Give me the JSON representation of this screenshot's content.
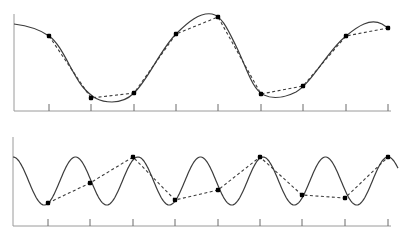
{
  "figure": {
    "panels": [
      {
        "id": "top",
        "label": "slowly varying signal (adequately sampled)",
        "axis": {
          "x0": 14,
          "y0": 111,
          "x1": 391,
          "ytop": 14
        },
        "ticks_x": [
          49,
          91,
          134,
          176,
          218,
          261,
          303,
          346,
          388
        ],
        "tick_len": 7,
        "curve_path": "M14,24 C30,26 42,31 49,36 C62,45 70,70 82,86 C92,98 100,102 112,102 C122,102 128,99 134,93 C148,80 160,50 176,34 C188,22 200,12 212,14 C222,16 228,30 236,46 C246,66 252,90 264,95 C272,99 284,98 296,92 C312,83 328,50 346,36 C358,26 370,18 382,24 L388,28",
        "samples": [
          {
            "x": 49,
            "y": 36
          },
          {
            "x": 91,
            "y": 98
          },
          {
            "x": 134,
            "y": 93
          },
          {
            "x": 176,
            "y": 34
          },
          {
            "x": 218,
            "y": 17
          },
          {
            "x": 261,
            "y": 94
          },
          {
            "x": 303,
            "y": 86
          },
          {
            "x": 346,
            "y": 36
          },
          {
            "x": 388,
            "y": 28
          }
        ]
      },
      {
        "id": "bottom",
        "label": "rapidly oscillating signal (undersampled / aliased)",
        "axis": {
          "x0": 13,
          "y0": 226,
          "x1": 391,
          "ytop": 137
        },
        "ticks_x": [
          48,
          90,
          133,
          175,
          218,
          260,
          302,
          345,
          388
        ],
        "tick_len": 7,
        "sine": {
          "x_start": 13,
          "x_end": 398,
          "center_y": 181,
          "amplitude": 24,
          "period": 62.5,
          "phase_x": 13
        },
        "samples": [
          {
            "x": 48,
            "y": 203
          },
          {
            "x": 90,
            "y": 183
          },
          {
            "x": 133,
            "y": 157
          },
          {
            "x": 175,
            "y": 200
          },
          {
            "x": 218,
            "y": 190
          },
          {
            "x": 260,
            "y": 157
          },
          {
            "x": 302,
            "y": 195
          },
          {
            "x": 345,
            "y": 198
          },
          {
            "x": 388,
            "y": 157
          }
        ]
      }
    ],
    "colors": {
      "curve": "#3c3c3c",
      "axis": "#9a9a9a",
      "dot": "#000000",
      "background": "#ffffff"
    }
  }
}
